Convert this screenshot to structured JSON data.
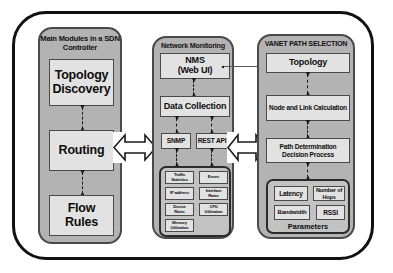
{
  "diagram": {
    "palette": {
      "outer_border": "#111111",
      "panel_fill": "#b3b3b3",
      "panel_border": "#4a4a4a",
      "node_fill": "#e2e2e2",
      "node_border": "#4a4a4a",
      "subpanel_fill": "#c2c2c2",
      "subpanel_border": "#2b2b2b",
      "text": "#0d0d0d",
      "connector": "#1a1a1a",
      "arrow_fill": "#ffffff"
    }
  },
  "columns": {
    "sdn_controller": {
      "title_line1": "Main Modules in",
      "title_line2": "a SDN Controller",
      "nodes": [
        {
          "label": "Topology Discovery",
          "line1": "Topology",
          "line2": "Discovery"
        },
        {
          "label": "Routing",
          "line1": "Routing",
          "line2": ""
        },
        {
          "label": "Flow Rules",
          "line1": "Flow Rules",
          "line2": ""
        }
      ]
    },
    "network_monitoring": {
      "title_line1": "Network Monitoring",
      "title_line2": "",
      "nms": {
        "line1": "NMS",
        "line2": "(Web UI)"
      },
      "data_collection": {
        "label": "Data Collection"
      },
      "protocols": [
        {
          "label": "SNMP"
        },
        {
          "label": "REST API"
        }
      ],
      "metrics": [
        {
          "line1": "Traffic",
          "line2": "Statistics"
        },
        {
          "line1": "Errors",
          "line2": ""
        },
        {
          "line1": "IP address",
          "line2": ""
        },
        {
          "line1": "Interface",
          "line2": "Rates"
        },
        {
          "line1": "Device",
          "line2": "Rates"
        },
        {
          "line1": "CPU",
          "line2": "Utilization"
        },
        {
          "line1": "Memory",
          "line2": "Utilization"
        }
      ]
    },
    "vanet_path_selection": {
      "title_line1": "VANET PATH SELECTION",
      "title_line2": "",
      "topology": {
        "label": "Topology"
      },
      "node_link_calculation": {
        "label": "Node and Link Calculation"
      },
      "path_determination": {
        "line1": "Path Determination",
        "line2": "Decision Process"
      },
      "parameters_label": "Parameters",
      "parameters": [
        {
          "line1": "Latency",
          "line2": ""
        },
        {
          "line1": "Number of",
          "line2": "Hops"
        },
        {
          "line1": "Bandwidth",
          "line2": ""
        },
        {
          "line1": "RSSI",
          "line2": ""
        }
      ]
    }
  },
  "connectors": {
    "sdn_internal": [
      {
        "name": "topology-discovery-to-routing",
        "style": "dashed",
        "bidirectional": true
      },
      {
        "name": "routing-to-flow-rules",
        "style": "dashed",
        "bidirectional": true
      }
    ],
    "monitoring_internal": [
      {
        "name": "nms-to-data-collection",
        "style": "dashed",
        "bidirectional": true
      },
      {
        "name": "data-collection-to-snmp",
        "style": "dashed",
        "bidirectional": true
      },
      {
        "name": "data-collection-to-rest-api",
        "style": "dashed",
        "bidirectional": true
      },
      {
        "name": "snmp-to-metrics",
        "style": "dashed",
        "bidirectional": true
      },
      {
        "name": "rest-api-to-metrics",
        "style": "dashed",
        "bidirectional": true
      }
    ],
    "vanet_internal": [
      {
        "name": "topology-to-node-link-calculation",
        "style": "dashed",
        "bidirectional": true
      },
      {
        "name": "node-link-calculation-to-path-determination",
        "style": "dashed",
        "bidirectional": true
      },
      {
        "name": "path-determination-to-parameters",
        "style": "dashed",
        "bidirectional": true
      }
    ],
    "cross_column": [
      {
        "name": "sdn-to-monitoring-arrow",
        "type": "double-headed-block-arrow"
      },
      {
        "name": "monitoring-to-vanet-arrow",
        "type": "double-headed-block-arrow"
      }
    ],
    "nms_to_topology": {
      "name": "nms-to-topology-link",
      "style": "solid",
      "bidirectional": true
    }
  }
}
